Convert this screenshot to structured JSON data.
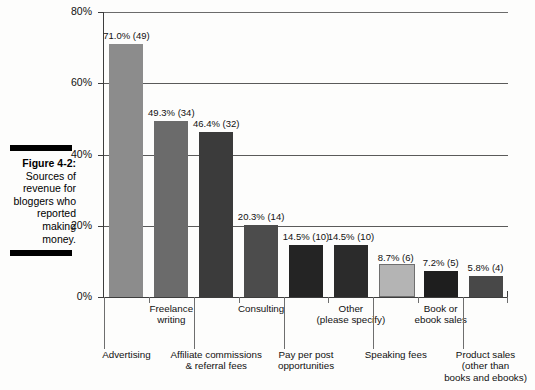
{
  "figure": {
    "number": "Figure 4-2:",
    "caption": " Sources of revenue for bloggers who reported making money."
  },
  "chart_data": {
    "type": "bar",
    "title": "",
    "xlabel": "",
    "ylabel": "",
    "ylim": [
      0,
      80
    ],
    "yticks": [
      "0%",
      "20%",
      "40%",
      "60%",
      "80%"
    ],
    "ytick_values": [
      0,
      20,
      40,
      60,
      80
    ],
    "grid": true,
    "legend": "none",
    "orientation": "vertical",
    "categories": [
      "Advertising",
      "Freelance writing",
      "Affiliate commissions & referral fees",
      "Consulting",
      "Pay per post opportunities",
      "Other (please specify)",
      "Speaking fees",
      "Book or ebook sales",
      "Product sales (other than books and ebooks)"
    ],
    "values": [
      71.0,
      49.3,
      46.4,
      20.3,
      14.5,
      14.5,
      8.7,
      7.2,
      5.8
    ],
    "counts": [
      49,
      34,
      32,
      14,
      10,
      10,
      6,
      5,
      4
    ],
    "data_labels": [
      "71.0% (49)",
      "49.3% (34)",
      "46.4% (32)",
      "20.3% (14)",
      "14.5% (10)",
      "14.5% (10)",
      "8.7% (6)",
      "7.2% (5)",
      "5.8% (4)"
    ],
    "bar_colors": [
      "#8c8c8c",
      "#6b6b6b",
      "#3b3b3b",
      "#4c4c4c",
      "#242424",
      "#2b2b2b",
      "#b4b4b4",
      "#1e1e1e",
      "#484848"
    ],
    "category_label_lines": [
      [
        "Advertising"
      ],
      [
        "Freelance",
        "writing"
      ],
      [
        "Affiliate commissions",
        "& referral fees"
      ],
      [
        "Consulting"
      ],
      [
        "Pay per post",
        "opportunities"
      ],
      [
        "Other",
        "(please specify)"
      ],
      [
        "Speaking fees"
      ],
      [
        "Book or",
        "ebook sales"
      ],
      [
        "Product sales",
        "(other than",
        "books and ebooks)"
      ]
    ],
    "category_label_row": [
      2,
      1,
      2,
      1,
      2,
      1,
      2,
      1,
      2
    ]
  }
}
